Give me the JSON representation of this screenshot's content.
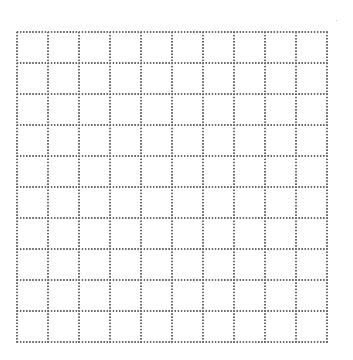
{
  "grid": {
    "rows": 10,
    "columns": 10,
    "cell_size_px": 31,
    "origin": {
      "x": 16,
      "y": 31
    },
    "line_style": "dotted",
    "dot_color": "#6a6a6a",
    "background_color": "#ffffff"
  }
}
